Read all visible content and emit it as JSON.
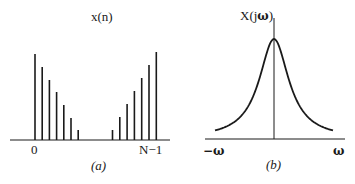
{
  "panel_a": {
    "title": "x(n)",
    "caption": "(a)",
    "tick_start": "0",
    "tick_end": "N−1",
    "left_stem_heights": [
      86,
      73,
      60,
      48,
      35,
      22,
      10
    ],
    "right_stem_heights": [
      10,
      23,
      36,
      49,
      62,
      75,
      88
    ]
  },
  "panel_b": {
    "title_prefix": "X(j",
    "title_omega": "ω",
    "title_suffix": ")",
    "caption": "(b)",
    "tick_left": "−ω",
    "tick_right": "ω"
  },
  "colors": {
    "ink": "#1a1a1a",
    "background": "#ffffff"
  }
}
